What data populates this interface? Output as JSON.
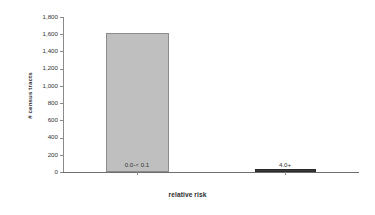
{
  "chart_data": {
    "type": "bar",
    "title": "",
    "subtitle": "",
    "xlabel": "relative risk",
    "ylabel": "# census tracts",
    "categories": [
      "0.0-< 0.1",
      "4.0+"
    ],
    "values": [
      1610,
      15
    ],
    "series": [
      {
        "name": "# census tracts",
        "values": [
          1610,
          15
        ],
        "colors": [
          "#bfbfbf",
          "#3a3a3a"
        ]
      }
    ],
    "ylim": [
      0,
      1800
    ],
    "xlim": [
      0,
      2
    ],
    "y_ticks": [
      0,
      200,
      400,
      600,
      800,
      1000,
      1200,
      1400,
      1600,
      1800
    ],
    "y_tick_labels": [
      "0",
      "200",
      "400",
      "600",
      "800",
      "1,000",
      "1,200",
      "1,400",
      "1,600",
      "1,800"
    ],
    "x_tick_labels": [
      "0.0-< 0.1",
      "4.0+"
    ],
    "grid": false,
    "legend": false,
    "legend_position": "none",
    "bar_fill_color": "#bfbfbf",
    "bar_border_color": "#8c8c8c",
    "bar_fill_color_2": "#3a3a3a",
    "axis_color": "#8a8a8a",
    "text_color": "#333333",
    "background_color": "#ffffff"
  }
}
